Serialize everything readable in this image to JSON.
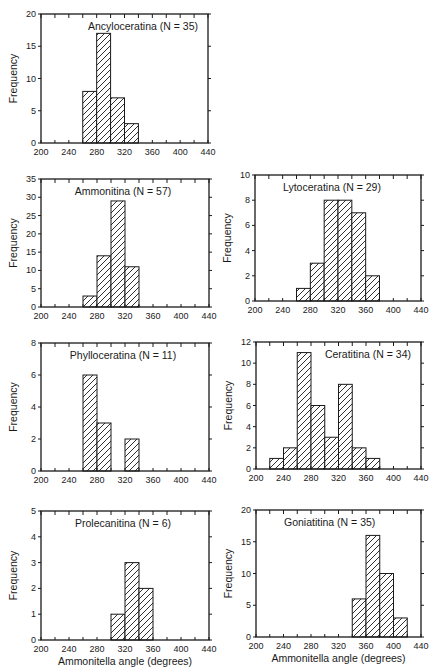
{
  "figure": {
    "x_axis_label": "Ammonitella angle (degrees)",
    "y_axis_label": "Frequency",
    "x_ticks": [
      200,
      240,
      280,
      320,
      360,
      400,
      440
    ],
    "x_range": [
      200,
      440
    ],
    "bin_width": 20,
    "colors": {
      "ink": "#1a1a1a",
      "background": "#ffffff"
    }
  },
  "chart_data": [
    {
      "type": "bar",
      "title": "Ancyloceratina (N = 35)",
      "xlabel": "",
      "ylabel": "Frequency",
      "bins": [
        [
          260,
          280
        ],
        [
          280,
          300
        ],
        [
          300,
          320
        ],
        [
          320,
          340
        ]
      ],
      "values": [
        8,
        17,
        7,
        3
      ],
      "xlim": [
        200,
        440
      ],
      "ylim": [
        0,
        20
      ],
      "y_ticks": [
        0,
        5,
        10,
        15,
        20
      ],
      "x_ticks": [
        200,
        240,
        280,
        320,
        360,
        400,
        440
      ],
      "grid": false,
      "hatch": "diagonal",
      "frame": {
        "x": 41,
        "y": 14,
        "w": 167,
        "h": 129
      },
      "title_pos": "right"
    },
    {
      "type": "bar",
      "title": "Ammonitina (N = 57)",
      "xlabel": "",
      "ylabel": "Frequency",
      "bins": [
        [
          260,
          280
        ],
        [
          280,
          300
        ],
        [
          300,
          320
        ],
        [
          320,
          340
        ]
      ],
      "values": [
        3,
        14,
        29,
        11
      ],
      "xlim": [
        200,
        440
      ],
      "ylim": [
        0,
        35
      ],
      "y_ticks": [
        0,
        5,
        10,
        15,
        20,
        25,
        30,
        35
      ],
      "x_ticks": [
        200,
        240,
        280,
        320,
        360,
        400,
        440
      ],
      "grid": false,
      "hatch": "diagonal",
      "frame": {
        "x": 41,
        "y": 179,
        "w": 168,
        "h": 128
      },
      "title_pos": "center"
    },
    {
      "type": "bar",
      "title": "Lytoceratina (N = 29)",
      "xlabel": "",
      "ylabel": "Frequency",
      "bins": [
        [
          260,
          280
        ],
        [
          280,
          300
        ],
        [
          300,
          320
        ],
        [
          320,
          340
        ],
        [
          340,
          360
        ],
        [
          360,
          380
        ]
      ],
      "values": [
        1,
        3,
        8,
        8,
        7,
        2
      ],
      "xlim": [
        200,
        440
      ],
      "ylim": [
        0,
        10
      ],
      "y_ticks": [
        0,
        2,
        4,
        6,
        8,
        10
      ],
      "x_ticks": [
        200,
        240,
        280,
        320,
        360,
        400,
        440
      ],
      "grid": false,
      "hatch": "diagonal",
      "frame": {
        "x": 255,
        "y": 175,
        "w": 166,
        "h": 126
      },
      "title_pos": "left"
    },
    {
      "type": "bar",
      "title": "Phylloceratina (N = 11)",
      "xlabel": "",
      "ylabel": "Frequency",
      "bins": [
        [
          260,
          280
        ],
        [
          280,
          300
        ],
        [
          300,
          320
        ],
        [
          320,
          340
        ]
      ],
      "values": [
        6,
        3,
        0,
        2
      ],
      "xlim": [
        200,
        440
      ],
      "ylim": [
        0,
        8
      ],
      "y_ticks": [
        0,
        2,
        4,
        6,
        8
      ],
      "x_ticks": [
        200,
        240,
        280,
        320,
        360,
        400,
        440
      ],
      "grid": false,
      "hatch": "diagonal",
      "frame": {
        "x": 41,
        "y": 343,
        "w": 168,
        "h": 128
      },
      "title_pos": "center"
    },
    {
      "type": "bar",
      "title": "Ceratitina (N = 34)",
      "xlabel": "",
      "ylabel": "Frequency",
      "bins": [
        [
          220,
          240
        ],
        [
          240,
          260
        ],
        [
          260,
          280
        ],
        [
          280,
          300
        ],
        [
          300,
          320
        ],
        [
          320,
          340
        ],
        [
          340,
          360
        ],
        [
          360,
          380
        ]
      ],
      "values": [
        1,
        2,
        11,
        6,
        3,
        8,
        2,
        1
      ],
      "xlim": [
        200,
        440
      ],
      "ylim": [
        0,
        12
      ],
      "y_ticks": [
        0,
        2,
        4,
        6,
        8,
        10,
        12
      ],
      "x_ticks": [
        200,
        240,
        280,
        320,
        360,
        400,
        440
      ],
      "grid": false,
      "hatch": "diagonal",
      "frame": {
        "x": 256,
        "y": 342,
        "w": 165,
        "h": 127
      },
      "title_pos": "right"
    },
    {
      "type": "bar",
      "title": "Prolecanitina (N = 6)",
      "xlabel": "Ammonitella angle (degrees)",
      "ylabel": "Frequency",
      "bins": [
        [
          300,
          320
        ],
        [
          320,
          340
        ],
        [
          340,
          360
        ]
      ],
      "values": [
        1,
        3,
        2
      ],
      "xlim": [
        200,
        440
      ],
      "ylim": [
        0,
        5
      ],
      "y_ticks": [
        0,
        1,
        2,
        3,
        4,
        5
      ],
      "x_ticks": [
        200,
        240,
        280,
        320,
        360,
        400,
        440
      ],
      "grid": false,
      "hatch": "diagonal",
      "frame": {
        "x": 41,
        "y": 511,
        "w": 168,
        "h": 129
      },
      "title_pos": "center"
    },
    {
      "type": "bar",
      "title": "Goniatitina (N = 35)",
      "xlabel": "Ammonitella angle (degrees)",
      "ylabel": "Frequency",
      "bins": [
        [
          340,
          360
        ],
        [
          360,
          380
        ],
        [
          380,
          400
        ],
        [
          400,
          420
        ]
      ],
      "values": [
        6,
        16,
        10,
        3
      ],
      "xlim": [
        200,
        440
      ],
      "ylim": [
        0,
        20
      ],
      "y_ticks": [
        0,
        5,
        10,
        15,
        20
      ],
      "x_ticks": [
        200,
        240,
        280,
        320,
        360,
        400,
        440
      ],
      "grid": false,
      "hatch": "diagonal",
      "frame": {
        "x": 256,
        "y": 510,
        "w": 165,
        "h": 127
      },
      "title_pos": "left"
    }
  ]
}
